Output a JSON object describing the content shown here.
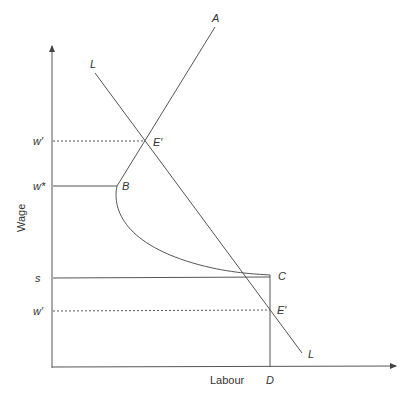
{
  "diagram": {
    "axes": {
      "x_label": "Labour",
      "y_label": "Wage"
    },
    "y_ticks": {
      "w_prime_upper": "w′",
      "w_star": "w*",
      "s": "s",
      "w_prime_lower": "w′"
    },
    "x_ticks": {
      "d": "D"
    },
    "curves": {
      "labour_demand_top": "L",
      "labour_demand_bottom": "L",
      "supply_A": "A"
    },
    "points": {
      "e_prime_upper": "E′",
      "b": "B",
      "c": "C",
      "e_prime_lower": "E′"
    },
    "colors": {
      "line": "#555555",
      "text": "#333333",
      "background": "#ffffff"
    }
  }
}
